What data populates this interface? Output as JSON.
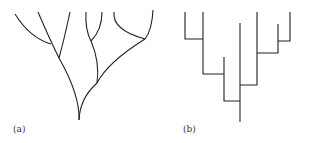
{
  "panels": [
    {
      "id": "a",
      "label": "(a)",
      "description": "curved branching tree (cladogram)"
    },
    {
      "id": "b",
      "label": "(b)",
      "description": "rectangular branching tree (dendrogram)"
    }
  ],
  "colors": {
    "stroke": "#222222",
    "background": "#ffffff"
  }
}
